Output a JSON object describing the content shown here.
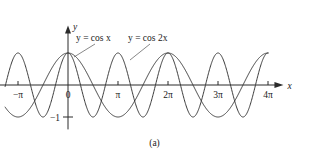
{
  "figure": {
    "caption": "(a)",
    "background": "#ffffff",
    "curve_color": "#3a3a3a",
    "axis_color": "#2b2b2b",
    "leader_color": "#555555"
  },
  "axes": {
    "x_axis_label": "x",
    "y_axis_label": "y",
    "x_ticks": [
      {
        "label": "−π",
        "value": -3.14159
      },
      {
        "label": "0",
        "value": 0
      },
      {
        "label": "π",
        "value": 3.14159
      },
      {
        "label": "2π",
        "value": 6.28319
      },
      {
        "label": "3π",
        "value": 9.42478
      },
      {
        "label": "4π",
        "value": 12.56637
      }
    ],
    "y_ticks": [
      {
        "label": "−1",
        "value": -1
      }
    ],
    "xlim": [
      -4.3,
      13.6
    ],
    "ylim": [
      -1.45,
      1.45
    ]
  },
  "labels": {
    "cos_x": "y = cos x",
    "cos_2x": "y = cos 2x"
  },
  "chart_data": {
    "type": "line",
    "title": "",
    "xlabel": "x",
    "ylabel": "y",
    "xlim": [
      -4.3,
      13.6
    ],
    "ylim": [
      -1.45,
      1.45
    ],
    "grid": false,
    "legend": "inline-annotations",
    "x_domain": [
      -3.95,
      12.57
    ],
    "x_tick_labels": [
      "−π",
      "0",
      "π",
      "2π",
      "3π",
      "4π"
    ],
    "x_tick_values": [
      -3.14159,
      0,
      3.14159,
      6.28319,
      9.42478,
      12.56637
    ],
    "y_tick_labels": [
      "−1"
    ],
    "y_tick_values": [
      -1
    ],
    "series": [
      {
        "name": "y = cos x",
        "expression": "cos(x)",
        "period": 6.28319,
        "amplitude": 1,
        "color": "#3a3a3a",
        "key_points": [
          {
            "x": -3.14159,
            "y": -1
          },
          {
            "x": -1.5708,
            "y": 0
          },
          {
            "x": 0,
            "y": 1
          },
          {
            "x": 1.5708,
            "y": 0
          },
          {
            "x": 3.14159,
            "y": -1
          },
          {
            "x": 4.71239,
            "y": 0
          },
          {
            "x": 6.28319,
            "y": 1
          },
          {
            "x": 7.85398,
            "y": 0
          },
          {
            "x": 9.42478,
            "y": -1
          },
          {
            "x": 10.99557,
            "y": 0
          },
          {
            "x": 12.56637,
            "y": 1
          }
        ]
      },
      {
        "name": "y = cos 2x",
        "expression": "cos(2x)",
        "period": 3.14159,
        "amplitude": 1,
        "color": "#3a3a3a",
        "key_points": [
          {
            "x": -3.14159,
            "y": 1
          },
          {
            "x": -2.35619,
            "y": 0
          },
          {
            "x": -1.5708,
            "y": -1
          },
          {
            "x": -0.7854,
            "y": 0
          },
          {
            "x": 0,
            "y": 1
          },
          {
            "x": 0.7854,
            "y": 0
          },
          {
            "x": 1.5708,
            "y": -1
          },
          {
            "x": 2.35619,
            "y": 0
          },
          {
            "x": 3.14159,
            "y": 1
          },
          {
            "x": 3.92699,
            "y": 0
          },
          {
            "x": 4.71239,
            "y": -1
          },
          {
            "x": 5.49779,
            "y": 0
          },
          {
            "x": 6.28319,
            "y": 1
          },
          {
            "x": 7.06858,
            "y": 0
          },
          {
            "x": 7.85398,
            "y": -1
          },
          {
            "x": 8.63938,
            "y": 0
          },
          {
            "x": 9.42478,
            "y": 1
          },
          {
            "x": 10.21018,
            "y": 0
          },
          {
            "x": 10.99557,
            "y": -1
          },
          {
            "x": 11.78097,
            "y": 0
          },
          {
            "x": 12.56637,
            "y": 1
          }
        ]
      }
    ],
    "annotations": [
      {
        "text": "y = cos x",
        "x_px": 76,
        "y_px": 41
      },
      {
        "text": "y = cos 2x",
        "x_px": 128,
        "y_px": 41
      }
    ]
  }
}
